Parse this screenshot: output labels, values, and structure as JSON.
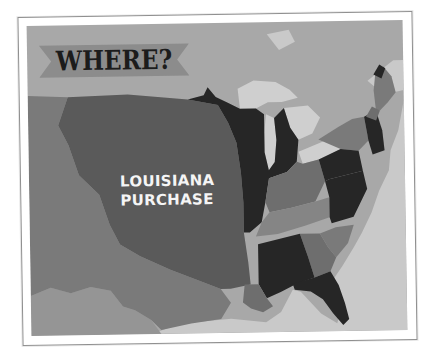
{
  "title_banner": {
    "text": "WHERE?",
    "ribbon_color": "#8c8c8c",
    "text_color": "#1c1c1c"
  },
  "map": {
    "region_label": {
      "line1": "LOUISIANA",
      "line2": "PURCHASE",
      "color": "#f5f5f5"
    },
    "colors": {
      "background_land": "#a8a8a8",
      "water": "#c9c9c9",
      "louisiana_purchase": "#5a5a5a",
      "western_territory": "#7a7a7a",
      "southwest_territory": "#959595",
      "dark_states": "#262626",
      "medium_states": "#6e6e6e",
      "light_states": "#858585",
      "great_lakes": "#cfcfcf",
      "frame_border": "#8f8f8f"
    }
  }
}
